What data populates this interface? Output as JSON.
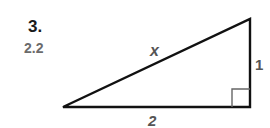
{
  "problem": {
    "number": "3.",
    "answer_note": "2.2"
  },
  "triangle": {
    "hypotenuse_label": "x",
    "vertical_leg_label": "1",
    "horizontal_leg_label": "2",
    "right_angle_marker": true,
    "colors": {
      "stroke": "#111111",
      "label": "#555555",
      "marker": "#666666"
    }
  }
}
